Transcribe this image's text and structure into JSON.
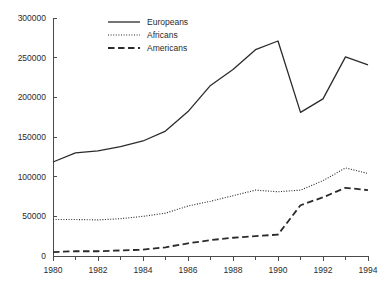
{
  "chart_data": {
    "type": "line",
    "title": "",
    "xlabel": "",
    "ylabel": "",
    "x": [
      1980,
      1981,
      1982,
      1983,
      1984,
      1985,
      1986,
      1987,
      1988,
      1989,
      1990,
      1991,
      1992,
      1993,
      1994
    ],
    "xlim": [
      1980,
      1994
    ],
    "ylim": [
      0,
      300000
    ],
    "grid": false,
    "legend_position": "top-center",
    "x_tick_labels": [
      "1980",
      "1982",
      "1984",
      "1986",
      "1988",
      "1990",
      "1992",
      "1994"
    ],
    "x_tick_values": [
      1980,
      1982,
      1984,
      1986,
      1988,
      1990,
      1992,
      1994
    ],
    "x_minor_tick_values": [
      1981,
      1983,
      1985,
      1987,
      1989,
      1991,
      1993
    ],
    "y_tick_labels": [
      "0",
      "50000",
      "100000",
      "150000",
      "200000",
      "250000",
      "300000"
    ],
    "y_tick_values": [
      0,
      50000,
      100000,
      150000,
      200000,
      250000,
      300000
    ],
    "series": [
      {
        "name": "Europeans",
        "style": "solid",
        "color": "#2b2b2b",
        "values": [
          118500,
          130000,
          132500,
          138000,
          145000,
          157500,
          182000,
          215000,
          235000,
          260000,
          271000,
          181000,
          198000,
          251000,
          241000
        ]
      },
      {
        "name": "Africans",
        "style": "dotted",
        "color": "#2b2b2b",
        "values": [
          46000,
          46000,
          45500,
          47000,
          50000,
          54000,
          63000,
          69000,
          76000,
          83000,
          81000,
          83000,
          95000,
          111000,
          104000
        ]
      },
      {
        "name": "Americans",
        "style": "dashed",
        "color": "#2b2b2b",
        "values": [
          5000,
          6000,
          6000,
          7000,
          8000,
          11000,
          16000,
          20000,
          23000,
          25000,
          27000,
          64000,
          74000,
          86000,
          83000
        ]
      }
    ]
  },
  "legend": {
    "items": [
      {
        "label": "Europeans",
        "style": "solid"
      },
      {
        "label": "Africans",
        "style": "dotted"
      },
      {
        "label": "Americans",
        "style": "dashed"
      }
    ]
  },
  "colors": {
    "ink": "#2b2b2b",
    "axis": "#4a4a4a",
    "background": "#ffffff"
  }
}
